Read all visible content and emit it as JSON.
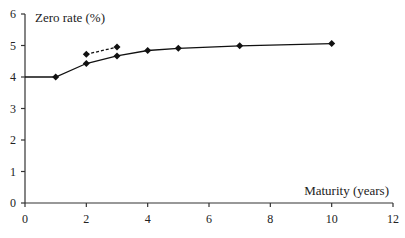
{
  "chart_data": {
    "type": "line",
    "title": "",
    "xlabel": "Maturity (years)",
    "ylabel": "Zero rate (%)",
    "xlim": [
      0,
      12
    ],
    "ylim": [
      0,
      6
    ],
    "xticks": [
      "0",
      "2",
      "4",
      "6",
      "8",
      "10",
      "12"
    ],
    "yticks": [
      "0",
      "1",
      "2",
      "3",
      "4",
      "5",
      "6"
    ],
    "grid": false,
    "legend": null,
    "series": [
      {
        "name": "Zero curve",
        "style": "solid",
        "x": [
          0,
          1,
          2,
          3,
          4,
          5,
          7,
          10
        ],
        "y": [
          4.0,
          4.0,
          4.43,
          4.67,
          4.84,
          4.91,
          4.99,
          5.06
        ],
        "markers": [
          false,
          true,
          true,
          true,
          true,
          true,
          true,
          true
        ]
      },
      {
        "name": "Bumped segment",
        "style": "dashed",
        "x": [
          2,
          3
        ],
        "y": [
          4.72,
          4.95
        ],
        "markers": [
          true,
          true
        ]
      }
    ]
  }
}
